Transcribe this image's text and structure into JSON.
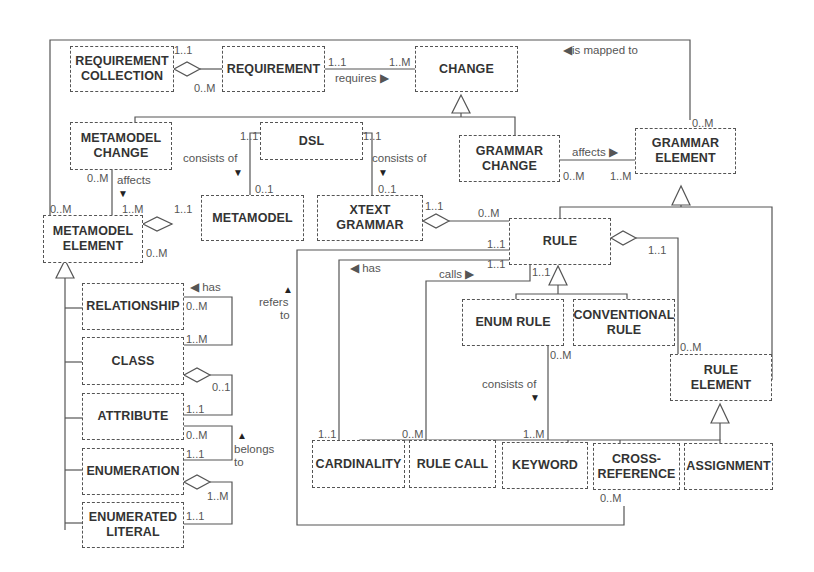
{
  "diagram": {
    "type": "UML class diagram",
    "classes": [
      {
        "id": "req_collection",
        "label": "REQUIREMENT\nCOLLECTION"
      },
      {
        "id": "requirement",
        "label": "REQUIREMENT"
      },
      {
        "id": "change",
        "label": "CHANGE"
      },
      {
        "id": "metamodel_change",
        "label": "METAMODEL\nCHANGE"
      },
      {
        "id": "dsl",
        "label": "DSL"
      },
      {
        "id": "grammar_change",
        "label": "GRAMMAR\nCHANGE"
      },
      {
        "id": "grammar_element",
        "label": "GRAMMAR\nELEMENT"
      },
      {
        "id": "metamodel_element",
        "label": "METAMODEL\nELEMENT"
      },
      {
        "id": "metamodel",
        "label": "METAMODEL"
      },
      {
        "id": "xtext_grammar",
        "label": "XTEXT\nGRAMMAR"
      },
      {
        "id": "rule",
        "label": "RULE"
      },
      {
        "id": "relationship",
        "label": "RELATIONSHIP"
      },
      {
        "id": "class",
        "label": "CLASS"
      },
      {
        "id": "attribute",
        "label": "ATTRIBUTE"
      },
      {
        "id": "enumeration",
        "label": "ENUMERATION"
      },
      {
        "id": "enumerated_literal",
        "label": "ENUMERATED\nLITERAL"
      },
      {
        "id": "enum_rule",
        "label": "ENUM RULE"
      },
      {
        "id": "conventional_rule",
        "label": "CONVENTIONAL\nRULE"
      },
      {
        "id": "rule_element",
        "label": "RULE\nELEMENT"
      },
      {
        "id": "cardinality",
        "label": "CARDINALITY"
      },
      {
        "id": "rule_call",
        "label": "RULE CALL"
      },
      {
        "id": "keyword",
        "label": "KEYWORD"
      },
      {
        "id": "cross_reference",
        "label": "CROSS-\nREFERENCE"
      },
      {
        "id": "assignment",
        "label": "ASSIGNMENT"
      }
    ],
    "labels": {
      "requires": "requires ▶",
      "is_mapped_to": "◀is mapped to",
      "affects_grammar": "affects ▶",
      "affects_mm": "affects",
      "affects_mm_arrow": "▼",
      "consists_of_mm": "consists of",
      "consists_of_mm_arrow": "▼",
      "consists_of_xt": "consists of",
      "consists_of_xt_arrow": "▼",
      "has_rule": "◀ has",
      "calls": "calls ▶",
      "refers_arrow": "▲",
      "refers": "refers",
      "refers_to": "to",
      "has_rel": "◀ has",
      "belongs_arrow": "▲",
      "belongs": "belongs",
      "belongs_to": "to",
      "consists_of_enum": "consists of",
      "consists_of_enum_arrow": "▼"
    },
    "multiplicities": {
      "rc_req_top": "1..1",
      "rc_req_bottom": "0..M",
      "req_change_left": "1..1",
      "req_change_right": "1..M",
      "mapped_ge": "0..M",
      "dsl_left": "1..1",
      "dsl_right": "1..1",
      "mm_01": "0..1",
      "xt_01": "0..1",
      "mmc_0M": "0..M",
      "mme_1M": "1..M",
      "mme_0M_top": "0..M",
      "mme_0M_right": "0..M",
      "mm_11": "1..1",
      "gc_0M": "0..M",
      "ge_1M": "1..M",
      "xt_11": "1..1",
      "rule_0M": "0..M",
      "rule_11_a": "1..1",
      "rule_11_b": "1..1",
      "rule_11_c": "1..1",
      "rule_11_right": "1..1",
      "re_0M": "0..M",
      "enumrule_0M": "0..M",
      "rel_0M": "0..M",
      "rel_1M": "1..M",
      "class_01": "0..1",
      "attr_11": "1..1",
      "attr_0M": "0..M",
      "enum_11": "1..1",
      "enum_1M": "1..M",
      "lit_11": "1..1",
      "card_11": "1..1",
      "rulecall_0M": "0..M",
      "keyword_1M": "1..M",
      "crossref_0M": "0..M"
    }
  }
}
